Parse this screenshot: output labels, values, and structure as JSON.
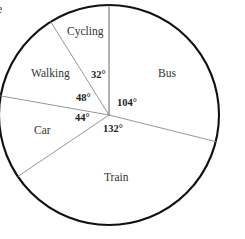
{
  "figure": {
    "edge_glyph": "e",
    "background_color": "#ffffff",
    "outline_color": "#111111",
    "spoke_color": "#8a8a8a",
    "text_color": "#2b2b2b"
  },
  "chart_data": {
    "type": "pie",
    "title": "",
    "subtitle": "",
    "xlabel": "",
    "ylabel": "",
    "grid": false,
    "legend_position": "none",
    "units": "degrees",
    "total_degrees": 360,
    "start_angle_deg": 0,
    "direction": "clockwise",
    "categories": [
      "Bus",
      "Train",
      "Car",
      "Walking",
      "Cycling"
    ],
    "values": [
      104,
      132,
      44,
      48,
      32
    ],
    "slices": [
      {
        "label": "Bus",
        "angle_label": "104°",
        "value": 104,
        "start_deg": 0,
        "end_deg": 104,
        "label_x": 158,
        "label_y": 68,
        "angle_label_x": 117,
        "angle_label_y": 98
      },
      {
        "label": "Train",
        "angle_label": "132°",
        "value": 132,
        "start_deg": 104,
        "end_deg": 236,
        "label_x": 104,
        "label_y": 172,
        "angle_label_x": 103,
        "angle_label_y": 124
      },
      {
        "label": "Car",
        "angle_label": "44°",
        "value": 44,
        "start_deg": 236,
        "end_deg": 280,
        "label_x": 34,
        "label_y": 125,
        "angle_label_x": 75,
        "angle_label_y": 113
      },
      {
        "label": "Walking",
        "angle_label": "48°",
        "value": 48,
        "start_deg": 280,
        "end_deg": 328,
        "label_x": 31,
        "label_y": 68,
        "angle_label_x": 76,
        "angle_label_y": 93
      },
      {
        "label": "Cycling",
        "angle_label": "32°",
        "value": 32,
        "start_deg": 328,
        "end_deg": 360,
        "label_x": 67,
        "label_y": 26,
        "angle_label_x": 91,
        "angle_label_y": 70
      }
    ],
    "geometry": {
      "center_x": 109,
      "center_y": 115,
      "radius": 110
    }
  }
}
